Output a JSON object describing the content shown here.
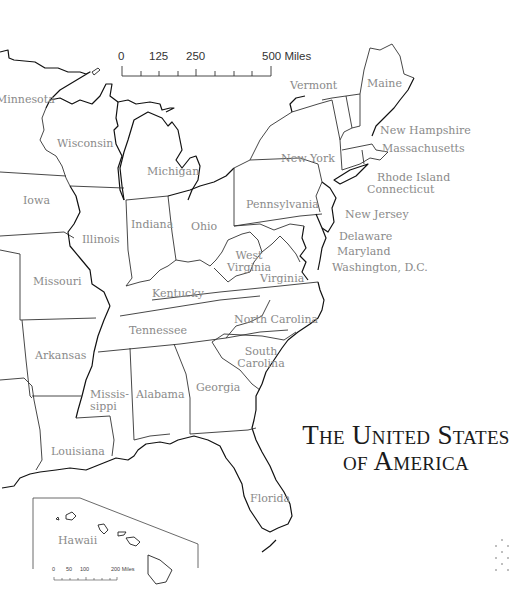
{
  "map": {
    "title_line1": "The United States",
    "title_line2": "of America",
    "scale_bar": {
      "ticks": [
        "0",
        "125",
        "250",
        "500 Miles"
      ]
    },
    "hawaii_scale_bar": {
      "ticks": [
        "0",
        "50",
        "100",
        "200 Miles"
      ]
    },
    "states": {
      "minnesota": "Minnesota",
      "wisconsin": "Wisconsin",
      "michigan": "Michigan",
      "iowa": "Iowa",
      "illinois": "Illinois",
      "indiana": "Indiana",
      "ohio": "Ohio",
      "pennsylvania": "Pennsylvania",
      "new_york": "New York",
      "vermont": "Vermont",
      "maine": "Maine",
      "new_hampshire": "New Hampshire",
      "massachusetts": "Massachusetts",
      "rhode_island": "Rhode Island",
      "connecticut": "Connecticut",
      "new_jersey": "New Jersey",
      "delaware": "Delaware",
      "maryland": "Maryland",
      "washington_dc": "Washington, D.C.",
      "west_virginia_1": "West",
      "west_virginia_2": "Virginia",
      "virginia": "Virginia",
      "missouri": "Missouri",
      "kentucky": "Kentucky",
      "tennessee": "Tennessee",
      "north_carolina": "North Carolina",
      "south_carolina_1": "South",
      "south_carolina_2": "Carolina",
      "arkansas": "Arkansas",
      "mississippi_1": "Missis-",
      "mississippi_2": "sippi",
      "alabama": "Alabama",
      "georgia": "Georgia",
      "louisiana": "Louisiana",
      "florida": "Florida",
      "hawaii": "Hawaii"
    }
  }
}
